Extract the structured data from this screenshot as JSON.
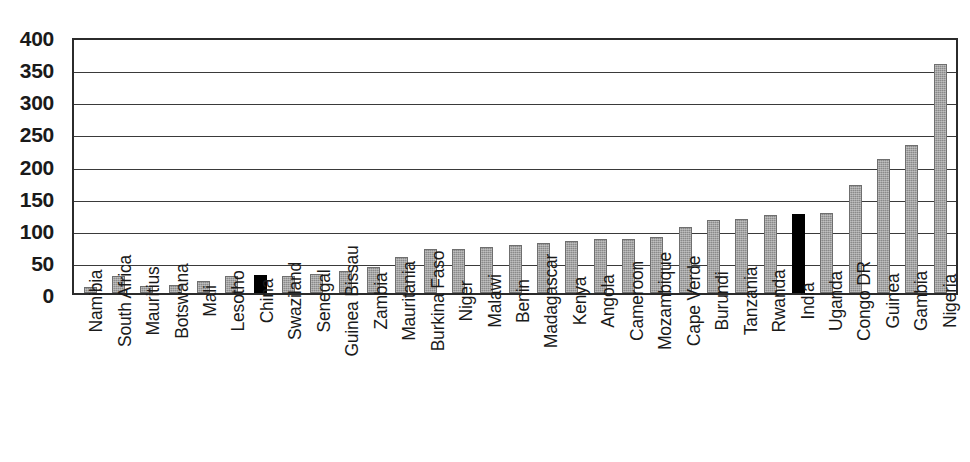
{
  "chart_data": {
    "type": "bar",
    "title": "",
    "subtitle": "",
    "xlabel": "",
    "ylabel": "",
    "ylim": [
      0,
      400
    ],
    "yticks": [
      400,
      350,
      300,
      250,
      200,
      150,
      100,
      50,
      0
    ],
    "grid": true,
    "grid_axis": "y",
    "legend": false,
    "legend_position": "none",
    "annotations": [
      "China and India bars are highlighted in solid black; all other bars are grey",
      "Countries are sorted in ascending order of value"
    ],
    "colors": {
      "bar_default": "#8a8a8a",
      "bar_highlight": "#000000",
      "axis": "#2b2b2b",
      "gridline": "#3a3a3a",
      "text": "#1a1a1a",
      "background": "#ffffff"
    },
    "highlighted_categories": [
      "China",
      "India"
    ],
    "categories": [
      "Namibia",
      "South Africa",
      "Mauritius",
      "Botswana",
      "Mali",
      "Lesotho",
      "China",
      "Swaziland",
      "Senegal",
      "Guinea Bissau",
      "Zambia",
      "Mauritania",
      "Burkina Faso",
      "Niger",
      "Malawi",
      "Benin",
      "Madagascar",
      "Kenya",
      "Angola",
      "Cameroon",
      "Mozambique",
      "Cape Verde",
      "Burundi",
      "Tanzania",
      "Rwanda",
      "India",
      "Uganda",
      "Congo DR",
      "Guinea",
      "Gambia",
      "Nigeria"
    ],
    "values": [
      9,
      27,
      11,
      12,
      19,
      26,
      28,
      26,
      29,
      35,
      41,
      56,
      69,
      69,
      72,
      75,
      78,
      81,
      84,
      84,
      87,
      102,
      113,
      115,
      122,
      123,
      124,
      168,
      208,
      231,
      357
    ],
    "series": [
      {
        "name": "value",
        "values": [
          9,
          27,
          11,
          12,
          19,
          26,
          28,
          26,
          29,
          35,
          41,
          56,
          69,
          69,
          72,
          75,
          78,
          81,
          84,
          84,
          87,
          102,
          113,
          115,
          122,
          123,
          124,
          168,
          208,
          231,
          357
        ]
      }
    ]
  }
}
